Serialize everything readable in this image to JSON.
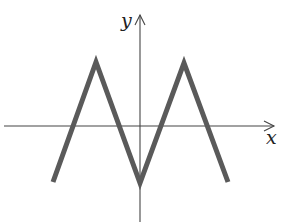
{
  "chart_data": {
    "type": "line",
    "title": "",
    "xlabel": "x",
    "ylabel": "y",
    "grid": false,
    "legend": null,
    "x": [
      -2.0,
      -1.0,
      0.0,
      1.0,
      2.0
    ],
    "series": [
      {
        "name": "y = f(x)",
        "values": [
          -1.0,
          1.1,
          -1.0,
          1.1,
          -1.0
        ]
      }
    ],
    "x_intercepts_approx": [
      -1.5,
      -0.5,
      0.5,
      1.5
    ],
    "xlim": [
      -3.1,
      3.0
    ],
    "ylim": [
      -1.7,
      2.0
    ],
    "color": "#5a5a5a"
  },
  "labels": {
    "x_axis": "x",
    "y_axis": "y"
  },
  "pixel_geometry": {
    "origin": [
      140,
      126
    ],
    "curve_points": [
      [
        53,
        182
      ],
      [
        96,
        62
      ],
      [
        140,
        183
      ],
      [
        184,
        63
      ],
      [
        228,
        182
      ]
    ],
    "x_axis": [
      4,
      274
    ],
    "y_axis": [
      14,
      222
    ]
  }
}
